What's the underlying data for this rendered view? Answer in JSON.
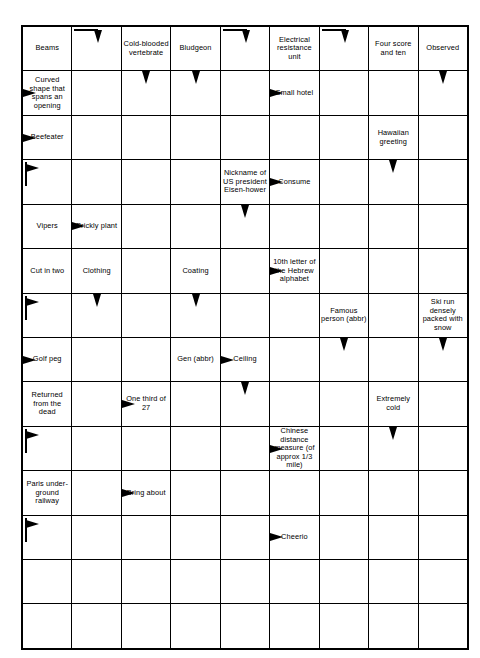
{
  "puzzle": {
    "type": "arrow-word-crossword",
    "columns": 9,
    "rows": 14,
    "ink_color": "#000000",
    "background_color": "#ffffff",
    "arrow_legend": {
      "down": "down-arrow",
      "right": "right-arrow",
      "bar-down": "bar-then-down-arrow",
      "stem-right": "stem-then-right-arrow"
    },
    "cells": [
      [
        {
          "clue": "Beams"
        },
        {
          "arrow": "bar-down"
        },
        {
          "clue": "Cold-blooded vertebrate"
        },
        {
          "clue": "Bludgeon"
        },
        {
          "arrow": "bar-down"
        },
        {
          "clue": "Electrical resistance unit"
        },
        {
          "arrow": "bar-down"
        },
        {
          "clue": "Four score and ten"
        },
        {
          "clue": "Observed"
        }
      ],
      [
        {
          "clue": "Curved shape that spans an opening",
          "arrow": "right"
        },
        {},
        {
          "arrow": "down"
        },
        {
          "arrow": "down"
        },
        {},
        {
          "clue": "Small hotel",
          "arrow": "right"
        },
        {},
        {},
        {
          "arrow": "down"
        }
      ],
      [
        {
          "clue": "Beefeater",
          "arrow": "right"
        },
        {},
        {},
        {},
        {},
        {},
        {},
        {
          "clue": "Hawaiian greeting"
        },
        {}
      ],
      [
        {
          "arrow": "stem-right"
        },
        {},
        {},
        {},
        {
          "clue": "Nickname of US president Eisen-hower"
        },
        {
          "clue": "Consume",
          "arrow": "right"
        },
        {},
        {
          "arrow": "down"
        },
        {}
      ],
      [
        {
          "clue": "Vipers"
        },
        {
          "clue": "Prickly plant",
          "arrow": "right"
        },
        {},
        {},
        {
          "arrow": "down"
        },
        {},
        {},
        {},
        {}
      ],
      [
        {
          "clue": "Cut in two"
        },
        {
          "clue": "Clothing"
        },
        {},
        {
          "clue": "Coating"
        },
        {},
        {
          "clue": "10th letter of the Hebrew alphabet",
          "arrow": "right"
        },
        {},
        {},
        {}
      ],
      [
        {
          "arrow": "stem-right"
        },
        {
          "arrow": "down"
        },
        {},
        {
          "arrow": "down"
        },
        {},
        {},
        {
          "clue": "Famous person (abbr)"
        },
        {},
        {
          "clue": "Ski run densely packed with snow"
        }
      ],
      [
        {
          "clue": "Golf peg",
          "arrow": "right"
        },
        {},
        {},
        {
          "clue": "Gen (abbr)"
        },
        {
          "clue": "Ceiling",
          "arrow": "right"
        },
        {},
        {
          "arrow": "down"
        },
        {},
        {
          "arrow": "down"
        }
      ],
      [
        {
          "clue": "Returned from the dead"
        },
        {},
        {
          "clue": "One third of 27",
          "arrow": "right"
        },
        {},
        {
          "arrow": "down"
        },
        {},
        {},
        {
          "clue": "Extremely cold"
        },
        {}
      ],
      [
        {
          "arrow": "stem-right"
        },
        {},
        {},
        {},
        {},
        {
          "clue": "Chinese distance measure (of approx 1/3 mile)",
          "arrow": "right"
        },
        {},
        {
          "arrow": "down"
        },
        {}
      ],
      [
        {
          "clue": "Paris under-ground railway"
        },
        {},
        {
          "clue": "Bring about",
          "arrow": "right"
        },
        {},
        {},
        {},
        {},
        {},
        {}
      ],
      [
        {
          "arrow": "stem-right"
        },
        {},
        {},
        {},
        {},
        {
          "clue": "Cheerio",
          "arrow": "right"
        },
        {},
        {},
        {}
      ],
      [
        {},
        {},
        {},
        {},
        {},
        {},
        {},
        {},
        {}
      ],
      [
        {},
        {},
        {},
        {},
        {},
        {},
        {},
        {},
        {}
      ]
    ]
  }
}
